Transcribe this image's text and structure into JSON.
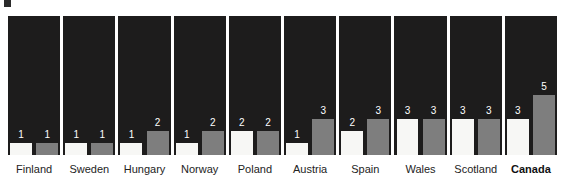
{
  "chart_data": {
    "type": "bar",
    "title": "",
    "subtitle": "",
    "xlabel": "",
    "ylabel": "",
    "ylim": [
      0,
      6
    ],
    "grid": false,
    "legend_position": "none",
    "categories": [
      "Finland",
      "Sweden",
      "Hungary",
      "Norway",
      "Poland",
      "Austria",
      "Spain",
      "Wales",
      "Scotland",
      "Canada"
    ],
    "series": [
      {
        "name": "light",
        "color": "#f7f7f5",
        "values": [
          1,
          1,
          1,
          1,
          2,
          1,
          2,
          3,
          3,
          3
        ]
      },
      {
        "name": "dark",
        "color": "#7e7e7e",
        "values": [
          1,
          1,
          2,
          2,
          2,
          3,
          3,
          3,
          3,
          5
        ]
      }
    ],
    "highlighted_category": "Canada",
    "panel_background": "#1d1c1c",
    "page_background": "#ffffff",
    "value_label_color": "#ffffff"
  },
  "panels": [
    {
      "label": "Finland",
      "bold": false,
      "light": 1,
      "dark": 1
    },
    {
      "label": "Sweden",
      "bold": false,
      "light": 1,
      "dark": 1
    },
    {
      "label": "Hungary",
      "bold": false,
      "light": 1,
      "dark": 2
    },
    {
      "label": "Norway",
      "bold": false,
      "light": 1,
      "dark": 2
    },
    {
      "label": "Poland",
      "bold": false,
      "light": 2,
      "dark": 2
    },
    {
      "label": "Austria",
      "bold": false,
      "light": 1,
      "dark": 3
    },
    {
      "label": "Spain",
      "bold": false,
      "light": 2,
      "dark": 3
    },
    {
      "label": "Wales",
      "bold": false,
      "light": 3,
      "dark": 3
    },
    {
      "label": "Scotland",
      "bold": false,
      "light": 3,
      "dark": 3
    },
    {
      "label": "Canada",
      "bold": true,
      "light": 3,
      "dark": 5
    }
  ]
}
